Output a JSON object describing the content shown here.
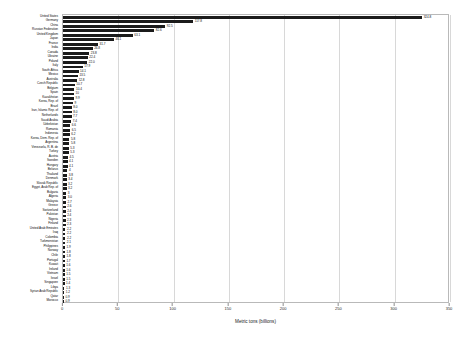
{
  "chart_data": {
    "type": "bar",
    "orientation": "horizontal",
    "title": "",
    "xlabel": "Metric tons (billions)",
    "ylabel": "",
    "xlim": [
      0,
      350
    ],
    "xticks": [
      0,
      50,
      100,
      150,
      200,
      250,
      300,
      350
    ],
    "grid": true,
    "legend": false,
    "value_labels": true,
    "categories": [
      "United States",
      "Germany",
      "China",
      "Russian Federation",
      "United Kingdom",
      "Japan",
      "France",
      "India",
      "Canada",
      "Ukraine",
      "Poland",
      "Italy",
      "South Africa",
      "Mexico",
      "Australia",
      "Czech Republic",
      "Belgium",
      "Spain",
      "Kazakhstan",
      "Korea, Rep. of",
      "Brazil",
      "Iran, Islamic Rep. of",
      "Netherlands",
      "Saudi Arabia",
      "Uzbekistan",
      "Romania",
      "Indonesia",
      "Korea, Dem. Rep. of",
      "Argentina",
      "Venezuela, R. B. de",
      "Turkey",
      "Austria",
      "Sweden",
      "Hungary",
      "Belarus",
      "Thailand",
      "Denmark",
      "Slovak Republic",
      "Egypt, Arab Rep. of",
      "Bulgaria",
      "Algeria",
      "Malaysia",
      "Greece",
      "Switzerland",
      "Pakistan",
      "Nigeria",
      "Finland",
      "United Arab Emirates",
      "Iraq",
      "Colombia",
      "Turkmenistan",
      "Philippines",
      "Norway",
      "Chile",
      "Portugal",
      "Kuwait",
      "Ireland",
      "Vietnam",
      "Israel",
      "Singapore",
      "Libya",
      "Syrian Arab Republic",
      "Qatar",
      "Morocco"
    ],
    "values": [
      324.8,
      117.8,
      92.5,
      82.6,
      63.1,
      46.1,
      31.7,
      26.8,
      23.8,
      22.4,
      22.0,
      17.9,
      14.1,
      13.5,
      12.8,
      10.7,
      10.4,
      10.0,
      9.9,
      9.0,
      8.0,
      8.0,
      7.7,
      7.4,
      6.6,
      6.5,
      6.2,
      5.8,
      5.8,
      5.3,
      5.3,
      4.5,
      4.1,
      4.1,
      4.0,
      3.8,
      3.4,
      3.2,
      3.2,
      3.0,
      3.0,
      2.7,
      2.6,
      2.4,
      2.4,
      2.3,
      2.3,
      2.2,
      2.2,
      2.2,
      2.1,
      1.9,
      1.8,
      1.8,
      1.7,
      1.6,
      1.6,
      1.5,
      1.5,
      1.4,
      1.3,
      1.2,
      0.9,
      0.9
    ],
    "value_label_texts": [
      "324.8",
      "117.8",
      "92.5",
      "82.6",
      "63.1",
      "46.1",
      "31.7",
      "26.8",
      "23.8",
      "22.4",
      "22.0",
      "17.9",
      "14.1",
      "13.5",
      "12.8",
      "10.7",
      "10.4",
      "10",
      "9.9",
      "9",
      "8.0",
      "8.0",
      "7.7",
      "7.4",
      "6.6",
      "6.5",
      "6.2",
      "5.8",
      "5.8",
      "5.3",
      "5.3",
      "4.5",
      "4.1",
      "4.1",
      "4",
      "3.8",
      "3.4",
      "3.2",
      "3.2",
      "3",
      "3.0",
      "2.7",
      "2.6",
      "2.4",
      "2.4",
      "2.3",
      "2.3",
      "2.2",
      "2.2",
      "2.2",
      "2.1",
      "1.9",
      "1.8",
      "1.8",
      "1.7",
      "1.6",
      "1.6",
      "1.5",
      "1.5",
      "1.4",
      "1.3",
      "1.2",
      "0.9",
      "0.9"
    ],
    "bar_color": "#1b1b1b"
  }
}
